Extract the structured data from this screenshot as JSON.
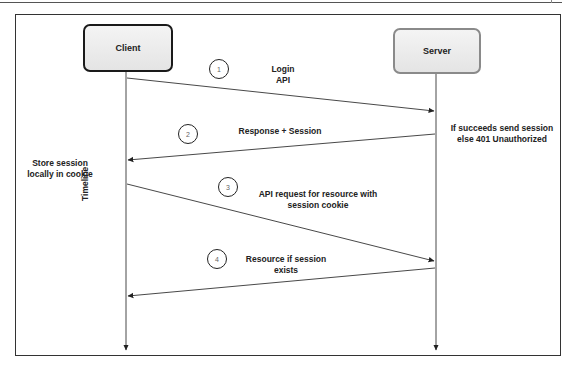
{
  "diagram": {
    "type": "sequence",
    "participants": [
      {
        "id": "client",
        "label": "Client"
      },
      {
        "id": "server",
        "label": "Server"
      }
    ],
    "messages": [
      {
        "step": "1",
        "from": "client",
        "to": "server",
        "label_line1": "Login",
        "label_line2": "API"
      },
      {
        "step": "2",
        "from": "server",
        "to": "client",
        "label_line1": "Response + Session",
        "label_line2": ""
      },
      {
        "step": "3",
        "from": "client",
        "to": "server",
        "label_line1": "API request for resource with",
        "label_line2": "session cookie"
      },
      {
        "step": "4",
        "from": "server",
        "to": "client",
        "label_line1": "Resource if session",
        "label_line2": "exists"
      }
    ],
    "notes": {
      "server_note_line1": "If succeeds send session",
      "server_note_line2": "else 401 Unauthorized",
      "client_note_line1": "Store session",
      "client_note_line2": "locally in cookie"
    },
    "timeline_label": "Timeline",
    "colors": {
      "client_border": "#1a1a1a",
      "server_border": "#8a8a8a",
      "line": "#333333"
    }
  }
}
